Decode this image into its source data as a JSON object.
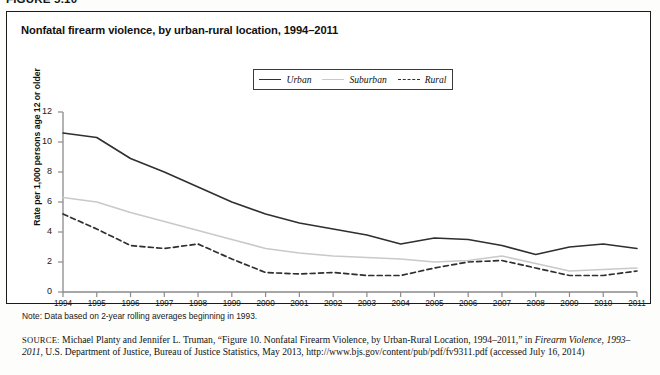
{
  "figure": {
    "number_label": "FIGURE 5.10",
    "title": "Nonfatal firearm violence, by urban-rural location, 1994–2011"
  },
  "legend": {
    "position": "top-center",
    "entries": [
      {
        "label": "Urban",
        "style": "solid",
        "color": "#2f2f2f",
        "icon": "line-solid-dark-icon"
      },
      {
        "label": "Suburban",
        "style": "solid",
        "color": "#c9c9c9",
        "icon": "line-solid-light-icon"
      },
      {
        "label": "Rural",
        "style": "dashed",
        "color": "#2f2f2f",
        "icon": "line-dashed-icon"
      }
    ]
  },
  "notes": {
    "note": "Note: Data based on 2-year rolling averages beginning in 1993."
  },
  "source": {
    "tag": "SOURCE:",
    "part1": " Michael Planty and Jennifer L. Truman, “Figure 10. Nonfatal Firearm Violence, by Urban-Rural Location, 1994–2011,” in ",
    "italic1": "Firearm Violence, 1993–2011",
    "part2": ", U.S. Department of Justice, Bureau of Justice Statistics, May 2013, http://www.bjs.gov/content/pub/pdf/fv9311.pdf (accessed July 16, 2014)"
  },
  "chart_data": {
    "type": "line",
    "title": "Nonfatal firearm violence, by urban-rural location, 1994–2011",
    "xlabel": "",
    "ylabel": "Rate per 1,000 persons age 12 or older",
    "ylim": [
      0,
      12
    ],
    "yticks": [
      0,
      2,
      4,
      6,
      8,
      10,
      12
    ],
    "grid": false,
    "legend_position": "top-center",
    "x": [
      1994,
      1995,
      1996,
      1997,
      1998,
      1999,
      2000,
      2001,
      2002,
      2003,
      2004,
      2005,
      2006,
      2007,
      2008,
      2009,
      2010,
      2011
    ],
    "xtick_labels": [
      "1994",
      "1995",
      "1996",
      "1997",
      "1998",
      "1999",
      "2000",
      "2001",
      "2002",
      "2003",
      "2004",
      "2005",
      "2006",
      "2007",
      "2008",
      "2009",
      "2010",
      "2011"
    ],
    "series": [
      {
        "name": "Urban",
        "color": "#2f2f2f",
        "style": "solid",
        "values": [
          10.6,
          10.3,
          8.9,
          8.0,
          7.0,
          6.0,
          5.2,
          4.6,
          4.2,
          3.8,
          3.2,
          3.6,
          3.5,
          3.1,
          2.5,
          3.0,
          3.2,
          2.9
        ]
      },
      {
        "name": "Suburban",
        "color": "#c9c9c9",
        "style": "solid",
        "values": [
          6.3,
          6.0,
          5.3,
          4.7,
          4.1,
          3.5,
          2.9,
          2.6,
          2.4,
          2.3,
          2.2,
          2.0,
          2.1,
          2.4,
          1.9,
          1.4,
          1.5,
          1.6
        ]
      },
      {
        "name": "Rural",
        "color": "#2f2f2f",
        "style": "dashed",
        "values": [
          5.2,
          4.2,
          3.1,
          2.9,
          3.2,
          2.2,
          1.3,
          1.2,
          1.3,
          1.1,
          1.1,
          1.6,
          2.0,
          2.1,
          1.6,
          1.1,
          1.1,
          1.4
        ]
      }
    ]
  }
}
